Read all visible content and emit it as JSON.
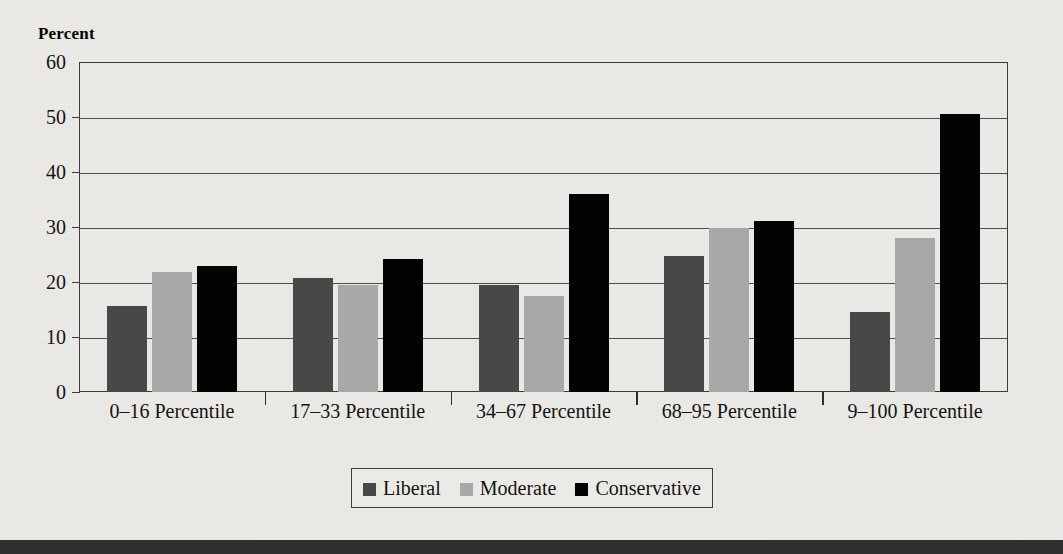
{
  "chart_data": {
    "type": "bar",
    "title": "",
    "subtitle": "",
    "xlabel": "",
    "ylabel": "Percent",
    "ylim": [
      0,
      60
    ],
    "ytick_step": 10,
    "yticks": [
      "60",
      "50",
      "40",
      "30",
      "20",
      "10",
      "0"
    ],
    "grid": true,
    "legend_position": "bottom-center",
    "categories": [
      "0–16 Percentile",
      "17–33 Percentile",
      "34–67 Percentile",
      "68–95 Percentile",
      "9–100 Percentile"
    ],
    "series": [
      {
        "name": "Liberal",
        "color": "#474747",
        "values": [
          15.6,
          20.8,
          19.4,
          24.8,
          14.5
        ]
      },
      {
        "name": "Moderate",
        "color": "#a9a9a9",
        "values": [
          21.8,
          19.5,
          17.4,
          29.9,
          28.0
        ]
      },
      {
        "name": "Conservative",
        "color": "#000000",
        "values": [
          23.0,
          24.1,
          36.0,
          31.1,
          50.6
        ]
      }
    ]
  },
  "axis": {
    "y_title": "Percent"
  },
  "legend": {
    "items": [
      {
        "label": "Liberal",
        "swatch": "liberal"
      },
      {
        "label": "Moderate",
        "swatch": "moderate"
      },
      {
        "label": "Conservative",
        "swatch": "conservative"
      }
    ]
  },
  "colors": {
    "background": "#ecebe7",
    "axis_line": "#39383a",
    "grid_line": "#4c4b4d",
    "liberal": "#474747",
    "moderate": "#a9a9a9",
    "conservative": "#000000",
    "bottom_band": "#2e2d2f"
  }
}
